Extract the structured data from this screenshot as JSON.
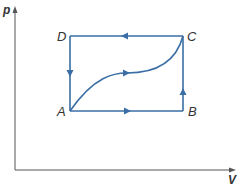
{
  "diagram": {
    "type": "pV diagram",
    "axes": {
      "y_label": "p",
      "x_label": "V"
    },
    "points": [
      {
        "name": "A",
        "label": "A"
      },
      {
        "name": "B",
        "label": "B"
      },
      {
        "name": "C",
        "label": "C"
      },
      {
        "name": "D",
        "label": "D"
      }
    ],
    "paths": [
      {
        "from": "A",
        "to": "B",
        "kind": "straight",
        "direction": "right"
      },
      {
        "from": "B",
        "to": "C",
        "kind": "straight",
        "direction": "up"
      },
      {
        "from": "C",
        "to": "D",
        "kind": "straight",
        "direction": "left"
      },
      {
        "from": "D",
        "to": "A",
        "kind": "straight",
        "direction": "down"
      },
      {
        "from": "A",
        "to": "C",
        "kind": "curve",
        "direction": "right"
      }
    ],
    "colors": {
      "path": "#3a6ea5",
      "axis": "#555555",
      "text": "#333333"
    }
  }
}
